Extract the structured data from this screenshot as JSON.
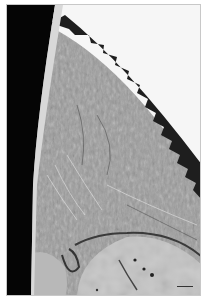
{
  "image": {
    "kind": "histology-micrograph",
    "description": "Grayscale light-microscopy section of tissue with a dark epithelial edge, fibrous connective tissue, and bone at the bottom",
    "colors": {
      "background": "#ffffff",
      "black_region": "#050505",
      "epithelium": "#1e1e1e",
      "connective_tissue": "#9a9a9a",
      "bone": "#c4c4c4",
      "empty_space": "#f6f6f6"
    },
    "scale_bar": {
      "visible": true,
      "label": ""
    }
  }
}
